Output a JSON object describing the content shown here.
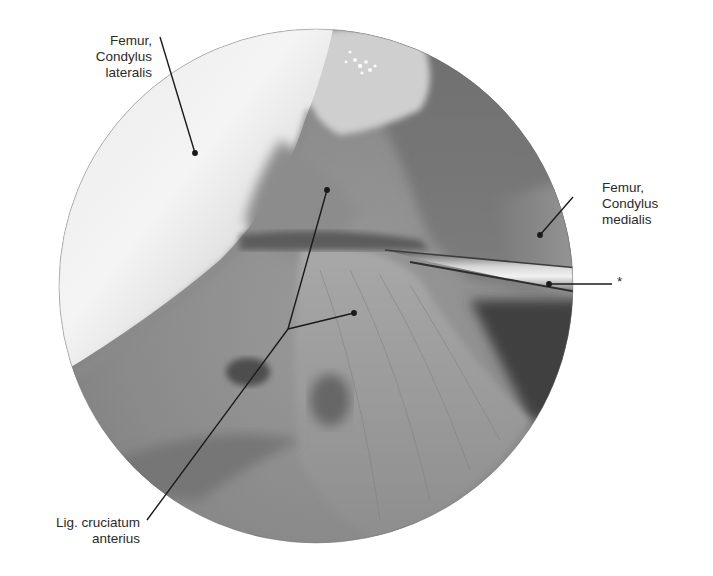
{
  "figure": {
    "type": "arthroscopic-photograph",
    "grayscale": true,
    "view_circle": {
      "cx": 316,
      "cy": 286,
      "r": 257
    }
  },
  "labels": {
    "condylus_lateralis": {
      "line1": "Femur,",
      "line2": "Condylus",
      "line3": "lateralis"
    },
    "condylus_medialis": {
      "line1": "Femur,",
      "line2": "Condylus",
      "line3": "medialis"
    },
    "instrument": {
      "text": "*"
    },
    "lig_cruciatum_anterius": {
      "line1": "Lig. cruciatum",
      "line2": "anterius"
    }
  },
  "colors": {
    "background": "#ffffff",
    "label_text": "#2a2a2a",
    "leader_line": "#1a1a1a"
  }
}
